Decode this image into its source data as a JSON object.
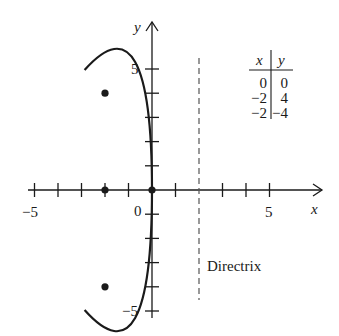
{
  "figure": {
    "type": "parabola-graph",
    "equation_implied": "y^2 = -8x",
    "axes": {
      "x_label": "x",
      "y_label": "y",
      "x_tick_labels": {
        "neg": "−5",
        "zero": "0",
        "pos": "5"
      },
      "y_tick_labels": {
        "pos": "5",
        "neg": "−5"
      },
      "x_range": [
        -5,
        7
      ],
      "y_range": [
        -5,
        6
      ]
    },
    "directrix": {
      "x": 2,
      "label": "Directrix",
      "style": "dashed"
    },
    "focus": {
      "x": -2,
      "y": 0
    },
    "points": [
      {
        "x": 0,
        "y": 0
      },
      {
        "x": -2,
        "y": 4
      },
      {
        "x": -2,
        "y": -4
      },
      {
        "x": -2,
        "y": 0
      }
    ],
    "table": {
      "headers": [
        "x",
        "y"
      ],
      "rows": [
        [
          "0",
          "0"
        ],
        [
          "−2",
          "4"
        ],
        [
          "−2",
          "−4"
        ]
      ]
    },
    "colors": {
      "ink": "#1a1a1a",
      "directrix": "#555555",
      "background": "#ffffff"
    }
  }
}
